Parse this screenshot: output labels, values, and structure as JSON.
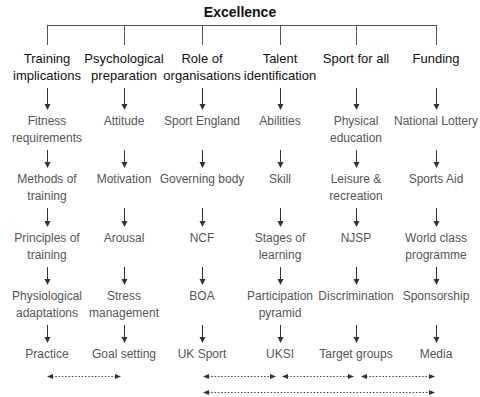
{
  "title": "Excellence",
  "columns": [
    {
      "heading": "Training implications",
      "items": [
        "Fitness requirements",
        "Methods of training",
        "Principles of training",
        "Physiological adaptations",
        "Practice"
      ]
    },
    {
      "heading": "Psychological preparation",
      "items": [
        "Attitude",
        "Motivation",
        "Arousal",
        "Stress management",
        "Goal setting"
      ]
    },
    {
      "heading": "Role of organisations",
      "items": [
        "Sport England",
        "Governing body",
        "NCF",
        "BOA",
        "UK Sport"
      ]
    },
    {
      "heading": "Talent identification",
      "items": [
        "Abilities",
        "Skill",
        "Stages of learning",
        "Participation pyramid",
        "UKSI"
      ]
    },
    {
      "heading": "Sport for all",
      "items": [
        "Physical education",
        "Leisure & recreation",
        "NJSP",
        "Discrimination",
        "Target groups"
      ]
    },
    {
      "heading": "Funding",
      "items": [
        "National Lottery",
        "Sports Aid",
        "World class programme",
        "Sponsorship",
        "Media"
      ]
    }
  ],
  "links": [
    {
      "from": "Practice",
      "to": "Goal setting"
    },
    {
      "from": "UK Sport",
      "to": "UKSI"
    },
    {
      "from": "UKSI",
      "to": "Target groups"
    },
    {
      "from": "Target groups",
      "to": "Media"
    },
    {
      "from": "UK Sport",
      "to": "Media"
    }
  ]
}
